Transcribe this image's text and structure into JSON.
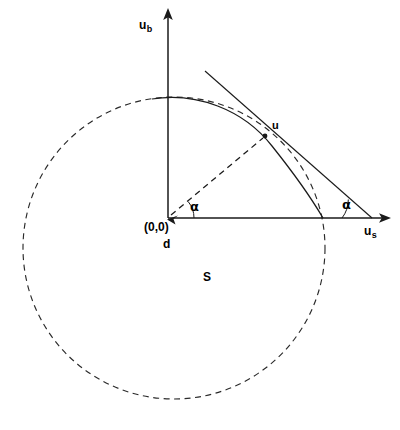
{
  "figure": {
    "width": 400,
    "height": 430,
    "background": "#ffffff",
    "stroke_color": "#1a1a1a",
    "labels": {
      "y_axis": {
        "base": "u",
        "sub": "b",
        "text": "ub"
      },
      "x_axis": {
        "base": "u",
        "sub": "s",
        "text": "us"
      },
      "tangent_point": "u",
      "origin": "(0,0)",
      "origin_sub": "d",
      "region": "S",
      "angle_origin": "α",
      "angle_axis": "α"
    },
    "geometry": {
      "origin": [
        168,
        218
      ],
      "y_axis_tip": [
        168,
        10
      ],
      "x_axis_tip": [
        390,
        218
      ],
      "circle": {
        "cx": 174,
        "cy": 248,
        "r": 151,
        "style": "dashed"
      },
      "curve": {
        "start": [
          152,
          99
        ],
        "through": [
          265,
          136
        ],
        "end": [
          323,
          218
        ],
        "style": "solid"
      },
      "tangent_line": {
        "start": [
          205,
          71
        ],
        "end": [
          372,
          218
        ],
        "style": "solid"
      },
      "radius_line": {
        "start": [
          168,
          218
        ],
        "end": [
          265,
          136
        ],
        "style": "dashed"
      },
      "point_u": [
        265,
        136
      ],
      "angle_arc_origin": {
        "cx": 168,
        "cy": 218,
        "r": 26
      },
      "angle_arc_axis": {
        "cx": 372,
        "cy": 218,
        "r": 30
      }
    },
    "label_positions": {
      "y_axis": [
        140,
        20
      ],
      "x_axis": [
        365,
        226
      ],
      "tangent_point": [
        272,
        123
      ],
      "origin": [
        145,
        222
      ],
      "origin_sub": [
        163,
        239
      ],
      "region": [
        203,
        272
      ],
      "angle_origin": [
        192,
        202
      ],
      "angle_axis": [
        343,
        200
      ]
    }
  }
}
